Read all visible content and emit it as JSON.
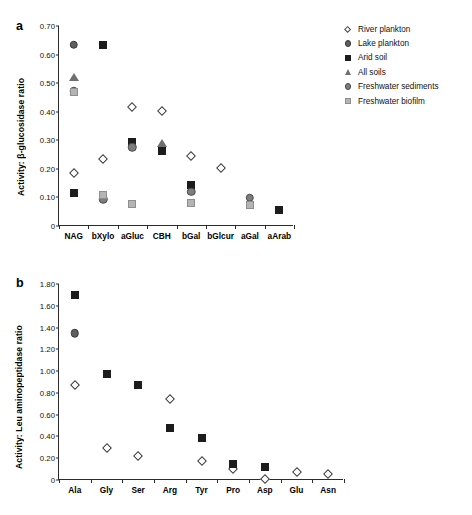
{
  "figure": {
    "panel_a_letter": "a",
    "panel_b_letter": "b"
  },
  "legend": {
    "items": [
      {
        "label": "River plankton",
        "marker": "open-diamond",
        "color": "#ffffff"
      },
      {
        "label": "Lake plankton",
        "marker": "filled-circle-dark",
        "color": "#5e5e5e"
      },
      {
        "label": "Arid soil",
        "marker": "filled-square-dark",
        "color": "#1c1c1c"
      },
      {
        "label": "All soils",
        "marker": "filled-triangle",
        "color": "#6f6f6f"
      },
      {
        "label": "Freshwater sediments",
        "marker": "filled-circle-mid",
        "color": "#7d7d7d"
      },
      {
        "label": "Freshwater biofilm",
        "marker": "filled-square-gray",
        "color": "#b4b4b4"
      }
    ]
  },
  "chart_data": [
    {
      "type": "scatter",
      "panel": "a",
      "title": "",
      "xlabel": "",
      "ylabel": "Activity: β-glucosidase ratio",
      "ylim": [
        0,
        0.7
      ],
      "yticks": [
        "0",
        "0.10",
        "0.20",
        "0.30",
        "0.40",
        "0.50",
        "0.60",
        "0.70"
      ],
      "ytick_values": [
        0,
        0.1,
        0.2,
        0.3,
        0.4,
        0.5,
        0.6,
        0.7
      ],
      "grid": false,
      "legend_position": "right",
      "categories": [
        "NAG",
        "bXylo",
        "aGluc",
        "CBH",
        "bGal",
        "bGlcur",
        "aGal",
        "aArab"
      ],
      "series": [
        {
          "name": "River plankton",
          "marker": "open-diamond",
          "values": [
            0.185,
            0.235,
            0.415,
            0.403,
            0.245,
            0.203,
            null,
            null
          ]
        },
        {
          "name": "Lake plankton",
          "marker": "filled-circle-dark",
          "values": [
            0.635,
            null,
            null,
            null,
            null,
            null,
            null,
            null
          ]
        },
        {
          "name": "Arid soil",
          "marker": "filled-square-dark",
          "values": [
            0.115,
            0.635,
            0.295,
            0.262,
            0.145,
            null,
            null,
            0.055
          ]
        },
        {
          "name": "All soils",
          "marker": "filled-triangle",
          "values": [
            0.52,
            null,
            null,
            0.29,
            null,
            null,
            null,
            null
          ]
        },
        {
          "name": "Freshwater sediments",
          "marker": "filled-circle-mid",
          "values": [
            0.472,
            0.093,
            0.275,
            null,
            0.12,
            null,
            0.099,
            null
          ]
        },
        {
          "name": "Freshwater biofilm",
          "marker": "filled-square-gray",
          "values": [
            0.47,
            0.11,
            0.077,
            null,
            0.082,
            null,
            0.072,
            null
          ]
        }
      ]
    },
    {
      "type": "scatter",
      "panel": "b",
      "title": "",
      "xlabel": "",
      "ylabel": "Activity: Leu aminopeptidase ratio",
      "ylim": [
        0,
        1.8
      ],
      "yticks": [
        "0",
        "0.20",
        "0.40",
        "0.60",
        "0.80",
        "1.00",
        "1.20",
        "1.40",
        "1.60",
        "1.80"
      ],
      "ytick_values": [
        0,
        0.2,
        0.4,
        0.6,
        0.8,
        1.0,
        1.2,
        1.4,
        1.6,
        1.8
      ],
      "grid": false,
      "legend_position": "none",
      "categories": [
        "Ala",
        "Gly",
        "Ser",
        "Arg",
        "Tyr",
        "Pro",
        "Asp",
        "Glu",
        "Asn"
      ],
      "series": [
        {
          "name": "River plankton",
          "marker": "open-diamond",
          "values": [
            0.87,
            0.295,
            0.225,
            0.74,
            0.175,
            0.105,
            0.005,
            0.07,
            0.055
          ]
        },
        {
          "name": "Lake plankton",
          "marker": "filled-circle-dark",
          "values": [
            1.35,
            null,
            null,
            null,
            null,
            null,
            null,
            null,
            null
          ]
        },
        {
          "name": "Arid soil",
          "marker": "filled-square-dark",
          "values": [
            1.7,
            0.97,
            0.875,
            0.475,
            0.39,
            0.145,
            0.115,
            null,
            null
          ]
        }
      ]
    }
  ]
}
